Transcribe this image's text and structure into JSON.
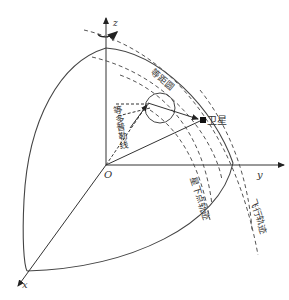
{
  "diagram": {
    "axes": {
      "x": "x",
      "y": "y",
      "z": "z",
      "origin": "O"
    },
    "labels": {
      "satellite": "卫星",
      "equidistance_circle": "等距圆",
      "iso_doppler_line": "等多普勒线",
      "subsatellite_track": "星下点轨迹",
      "flight_track": "飞行轨迹"
    },
    "colors": {
      "line": "#444444",
      "background": "#ffffff"
    }
  }
}
